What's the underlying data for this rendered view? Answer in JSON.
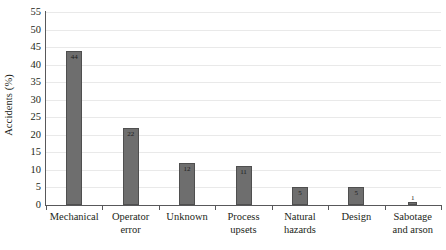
{
  "chart_data": {
    "type": "bar",
    "title": "",
    "xlabel": "",
    "ylabel": "Accidents (%)",
    "ylim": [
      0,
      55
    ],
    "ytick_step": 5,
    "yticks": [
      0,
      5,
      10,
      15,
      20,
      25,
      30,
      35,
      40,
      45,
      50,
      55
    ],
    "grid": true,
    "legend": "none",
    "bar_color": "#6e6e6e",
    "bar_edge_color": "#4f4f4f",
    "gridline_color": "#e9e9e9",
    "axis_color": "#58585a",
    "categories": [
      "Mechanical",
      "Operator error",
      "Unknown",
      "Process upsets",
      "Natural hazards",
      "Design",
      "Sabotage and arson"
    ],
    "category_lines": [
      [
        "Mechanical"
      ],
      [
        "Operator",
        "error"
      ],
      [
        "Unknown"
      ],
      [
        "Process",
        "upsets"
      ],
      [
        "Natural",
        "hazards"
      ],
      [
        "Design"
      ],
      [
        "Sabotage",
        "and arson"
      ]
    ],
    "values": [
      44,
      22,
      12,
      11,
      5,
      5,
      1
    ],
    "value_labels": [
      "44",
      "22",
      "12",
      "11",
      "5",
      "5",
      "1"
    ]
  }
}
